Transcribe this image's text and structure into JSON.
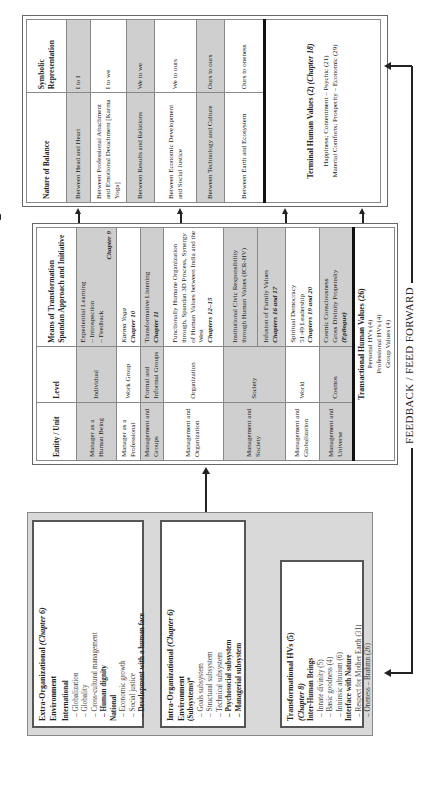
{
  "left_boxes": {
    "extra_org": {
      "title": "Extra-Organizational",
      "chapter": "(Chapter 6)",
      "subtitle": "Environment",
      "sections": [
        {
          "heading": "International",
          "items": [
            {
              "text": "– Globalization",
              "bold": false
            },
            {
              "text": "– Globality",
              "bold": false
            },
            {
              "text": "– Cross-cultural management",
              "bold": false
            },
            {
              "text": "– Human dignity",
              "bold": true
            }
          ]
        },
        {
          "heading": "National",
          "items": [
            {
              "text": "– Economic growth",
              "bold": false
            },
            {
              "text": "– Social justice",
              "bold": false
            },
            {
              "text": "– Development with a human face",
              "bold": true
            }
          ]
        }
      ]
    },
    "intra_org": {
      "title": "Intra-Organizational",
      "chapter": "(Chapter 6)",
      "subtitle": "Environment",
      "subtitle2": "(Subsystems)*",
      "items": [
        {
          "text": "– Goals subsystem",
          "bold": false
        },
        {
          "text": "– Structural subsystem",
          "bold": false
        },
        {
          "text": "– Technical subsystem",
          "bold": false
        },
        {
          "text": "– Psychosocial subsystem",
          "bold": true
        },
        {
          "text": "– Managerial subsystem",
          "bold": true
        }
      ]
    },
    "transformational": {
      "title": "Transformational HVs (5)",
      "chapter": "(Chapter 8)",
      "sections": [
        {
          "heading": "Inter-Human Beings",
          "items": [
            "– Innate divinity (5)",
            "– Basic goodness (4)",
            "– Intrinsic altruism (6)"
          ]
        },
        {
          "heading": "Interface with Nature",
          "items": [
            "– Respect for Mother Earth (31)",
            "– Oneness – Brahmn (26)"
          ]
        }
      ]
    }
  },
  "middle_table": {
    "headers": [
      "Entity / Unit",
      "Level",
      "Means of Transformation Spandan Approach and Initiative"
    ],
    "rows": [
      {
        "entity": "Manager as a Human Being",
        "level": "Individual",
        "means": "Experiential Learning\n  – Introspection\n  – Feedback",
        "chapter": "Chapter 9",
        "shaded": true
      },
      {
        "entity": "Manager as a Professional",
        "level": "Work Group",
        "means": "Karma Yoga",
        "chapter": "Chapter 10",
        "shaded": false
      },
      {
        "entity": "Management and Groups",
        "level": "Formal and Informal Groups",
        "means": "Transformative Listening",
        "chapter": "Chapter 11",
        "shaded": true
      },
      {
        "entity": "Management and Organization",
        "level": "Organization",
        "means": "Functionally Humane Organization through, Spandan 3D Process, Synergy of Human Values between India and the West",
        "chapter": "Chapters 12–15",
        "shaded": false
      },
      {
        "entity": "Management and Society",
        "level": "Society",
        "means": "Institutional Civic Responsibility through Human Values (ICR-HV)",
        "means2": "Infusion of Family Values",
        "chapter": "Chapters 16 and 17",
        "shaded": true
      },
      {
        "entity": "Management and Globalization",
        "level": "World",
        "means": "Spiritual Democracy\n51:49 Leadership",
        "chapter": "Chapters 19 and 20",
        "shaded": false
      },
      {
        "entity": "Management and Universe",
        "level": "Cosmos",
        "means": "Cosmic Consciousness\nGross Divinity Propensity",
        "chapter": "(Epilogue)",
        "shaded": true
      }
    ],
    "summary": {
      "title": "Transactional Human Values (26)",
      "lines": [
        "Personal HVs (4)",
        "Professional HVs (4)",
        "Group Values (4)"
      ]
    }
  },
  "right_table": {
    "headers": [
      "Nature of Balance",
      "Symbolic Representation"
    ],
    "rows": [
      {
        "balance": "Between Head and Heart",
        "symbol": "I to I",
        "shaded": true
      },
      {
        "balance": "Between Professional Attachment and Emotional Detachment [Karma Yoga]",
        "symbol": "I to we",
        "shaded": false
      },
      {
        "balance": "Between Results and Relations",
        "symbol": "We to we",
        "shaded": true
      },
      {
        "balance": "Between Economic Development and Social Justice",
        "symbol": "We to ours",
        "shaded": false
      },
      {
        "balance": "Between Technology and Culture",
        "symbol": "Ours to ours",
        "shaded": true
      },
      {
        "balance": "Between Earth and Ecosystem",
        "symbol": "Ours to oneness",
        "shaded": false
      }
    ],
    "terminal": {
      "title": "Terminal Human Values (2)",
      "chapter": "(Chapter 18)",
      "lines": [
        "Happiness; Contentment – Psychic (21)",
        "Material Comforts; Prosperity – Economic (29)"
      ]
    }
  },
  "feedback": {
    "label": "FEEDBACK / FEED FORWARD"
  },
  "colors": {
    "shade": "#cfcfcf",
    "panel": "#d9d9d9",
    "line": "#222222"
  }
}
